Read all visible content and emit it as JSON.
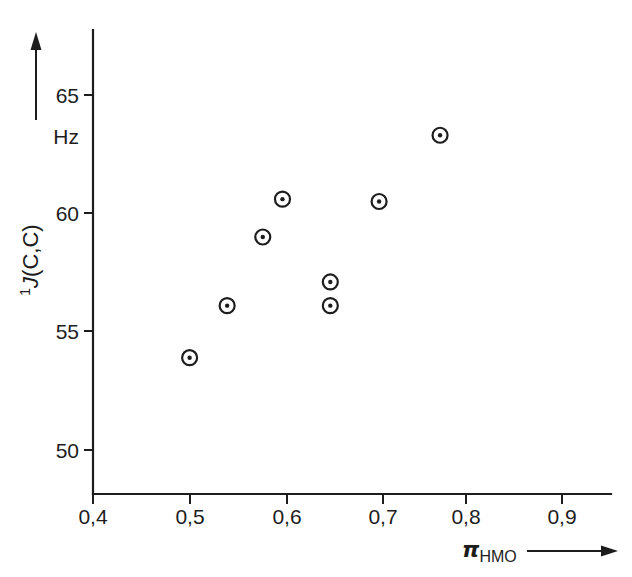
{
  "figure": {
    "background_color": "#ffffff",
    "ink_color": "#1d1d1d"
  },
  "axes": {
    "y": {
      "title_prefix": "1",
      "title_main": "J",
      "title_rest": "(C,C)",
      "unit": "Hz",
      "tick_labels": [
        "65",
        "60",
        "55",
        "50"
      ],
      "tick_values": [
        65,
        60,
        55,
        50
      ],
      "arrow": "up-arrow-icon"
    },
    "x": {
      "title_symbol": "π",
      "title_subscript": "HMO",
      "tick_labels": [
        "0,4",
        "0,5",
        "0,6",
        "0,7",
        "0,8",
        "0,9"
      ],
      "tick_values": [
        0.4,
        0.5,
        0.6,
        0.7,
        0.8,
        0.9
      ],
      "arrow": "right-arrow-icon"
    }
  },
  "chart_data": {
    "type": "scatter",
    "title": "",
    "xlabel": "π_HMO",
    "ylabel": "1J(C,C) / Hz",
    "xlim": [
      0.38,
      0.94
    ],
    "ylim": [
      48.1,
      66.4
    ],
    "grid": false,
    "legend": "none",
    "marker": "circle-with-center-dot",
    "x": [
      0.503,
      0.543,
      0.581,
      0.602,
      0.653,
      0.653,
      0.705,
      0.77
    ],
    "y": [
      53.9,
      56.1,
      59.0,
      60.6,
      57.1,
      56.1,
      60.5,
      63.3
    ],
    "points": [
      {
        "x": 0.503,
        "y": 53.9
      },
      {
        "x": 0.543,
        "y": 56.1
      },
      {
        "x": 0.581,
        "y": 59.0
      },
      {
        "x": 0.602,
        "y": 60.6
      },
      {
        "x": 0.653,
        "y": 57.1
      },
      {
        "x": 0.653,
        "y": 56.1
      },
      {
        "x": 0.705,
        "y": 60.5
      },
      {
        "x": 0.77,
        "y": 63.3
      }
    ]
  }
}
